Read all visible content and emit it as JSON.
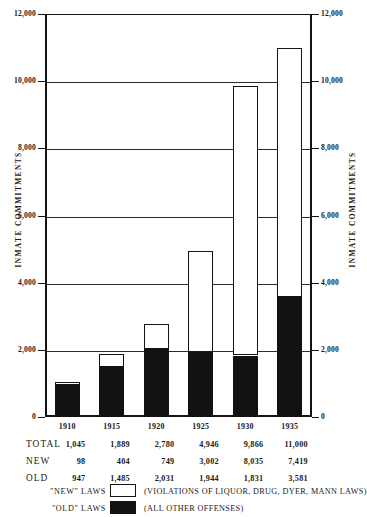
{
  "chart_data": {
    "type": "bar",
    "stacked": true,
    "title": "",
    "xlabel": "",
    "ylabel": "INMATE COMMITMENTS",
    "ylabel_right": "INMATE COMMITMENTS",
    "ylim": [
      0,
      12000
    ],
    "ytick_values": [
      0,
      2000,
      4000,
      6000,
      8000,
      10000,
      12000
    ],
    "ytick_labels": [
      "0",
      "2,000",
      "4,000",
      "6,000",
      "8,000",
      "10,000",
      "12,000"
    ],
    "grid": true,
    "legend_position": "below-table",
    "categories": [
      "1910",
      "1915",
      "1920",
      "1925",
      "1930",
      "1935"
    ],
    "series": [
      {
        "name": "\"OLD\" LAWS",
        "description": "(ALL OTHER OFFENSES)",
        "color": "#111111",
        "values": [
          947,
          1485,
          2031,
          1944,
          1831,
          3581
        ]
      },
      {
        "name": "\"NEW\" LAWS",
        "description": "(VIOLATIONS OF LIQUOR, DRUG, DYER, MANN LAWS)",
        "color": "#ffffff",
        "values": [
          98,
          404,
          749,
          3002,
          8035,
          7419
        ]
      }
    ],
    "totals": [
      1045,
      1889,
      2780,
      4946,
      9866,
      11000
    ]
  },
  "axis": {
    "left_title": "INMATE COMMITMENTS",
    "right_title": "INMATE COMMITMENTS",
    "ticks": [
      {
        "value": 12000,
        "label": "12,000"
      },
      {
        "value": 10000,
        "label": "10,000"
      },
      {
        "value": 8000,
        "label": "8,000"
      },
      {
        "value": 6000,
        "label": "6,000"
      },
      {
        "value": 4000,
        "label": "4,000"
      },
      {
        "value": 2000,
        "label": "2,000"
      },
      {
        "value": 0,
        "label": "0"
      }
    ]
  },
  "years": [
    "1910",
    "1915",
    "1920",
    "1925",
    "1930",
    "1935"
  ],
  "table": {
    "rows": [
      {
        "label": "TOTAL",
        "values": [
          "1,045",
          "1,889",
          "2,780",
          "4,946",
          "9,866",
          "11,000"
        ]
      },
      {
        "label": "NEW",
        "values": [
          "98",
          "404",
          "749",
          "3,002",
          "8,035",
          "7,419"
        ]
      },
      {
        "label": "OLD",
        "values": [
          "947",
          "1,485",
          "2,031",
          "1,944",
          "1,831",
          "3,581"
        ]
      }
    ]
  },
  "legend": {
    "items": [
      {
        "label": "\"NEW\" LAWS",
        "swatch": "white",
        "description": "(VIOLATIONS OF LIQUOR, DRUG, DYER, MANN LAWS)"
      },
      {
        "label": "\"OLD\" LAWS",
        "swatch": "black",
        "description": "(ALL OTHER OFFENSES)"
      }
    ]
  },
  "colors": {
    "new_laws": "#ffffff",
    "old_laws": "#111111",
    "axis": "#141414",
    "grid": "#2b2b2b",
    "background": "#ffffff"
  }
}
